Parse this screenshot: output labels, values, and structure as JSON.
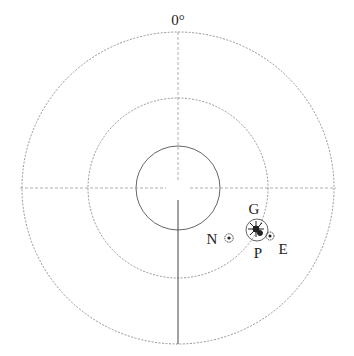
{
  "diagram": {
    "type": "polar-position-plot",
    "angle_label": "0°",
    "center": {
      "x": 178,
      "y": 188
    },
    "rings": [
      {
        "name": "inner",
        "radius": 42,
        "style": "solid"
      },
      {
        "name": "middle",
        "radius": 90,
        "style": "dotted"
      },
      {
        "name": "outer",
        "radius": 156,
        "style": "dotted"
      }
    ],
    "markers": [
      {
        "id": "G",
        "label": "G",
        "x": 257,
        "y": 230,
        "kind": "large-circle-with-cluster"
      },
      {
        "id": "N",
        "label": "N",
        "x": 229,
        "y": 238,
        "kind": "dotted-circle"
      },
      {
        "id": "E",
        "label": "E",
        "x": 270,
        "y": 236,
        "kind": "dotted-circle"
      },
      {
        "id": "P",
        "label": "P",
        "kind": "label-only"
      }
    ],
    "labels": {
      "zero": "0°",
      "G": "G",
      "N": "N",
      "E": "E",
      "P": "P"
    },
    "colors": {
      "line": "#555555",
      "faint": "#9a9a9a",
      "text": "#222222"
    }
  }
}
